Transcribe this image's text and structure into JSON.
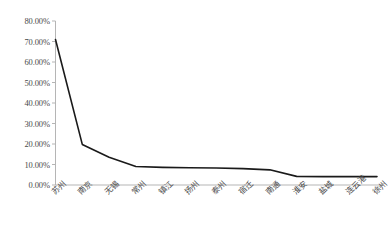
{
  "chart_data": {
    "type": "line",
    "title": "",
    "subtitle": "",
    "xlabel": "",
    "ylabel": "",
    "categories": [
      "苏州",
      "南京",
      "无锡",
      "常州",
      "镇江",
      "扬州",
      "泰州",
      "宿迁",
      "南通",
      "淮安",
      "盐城",
      "连云港",
      "徐州"
    ],
    "values": [
      71.0,
      19.8,
      13.5,
      9.0,
      8.6,
      8.4,
      8.3,
      8.0,
      7.4,
      4.2,
      4.1,
      4.1,
      4.1
    ],
    "series": [
      {
        "name": "",
        "values": [
          71.0,
          19.8,
          13.5,
          9.0,
          8.6,
          8.4,
          8.3,
          8.0,
          7.4,
          4.2,
          4.1,
          4.1,
          4.1
        ]
      }
    ],
    "ylim": [
      0,
      80
    ],
    "ytick_values": [
      0,
      10,
      20,
      30,
      40,
      50,
      60,
      70,
      80
    ],
    "ytick_labels": [
      "0.00%",
      "10.00%",
      "20.00%",
      "30.00%",
      "40.00%",
      "50.00%",
      "60.00%",
      "70.00%",
      "80.00%"
    ],
    "grid": false,
    "legend": false,
    "legend_position": "none",
    "line_color": "#1a1a1a",
    "axis_color": "#b5b5b5",
    "markers": false,
    "xtick_rotation": -45
  }
}
